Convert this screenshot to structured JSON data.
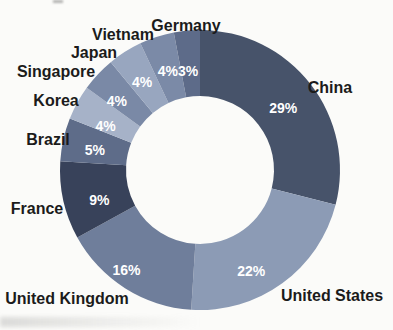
{
  "chart_data": {
    "type": "pie",
    "subtype": "doughnut",
    "title": "",
    "unit": "%",
    "direction": "clockwise",
    "start_angle_deg": 0,
    "hole_radius_ratio": 0.53,
    "legend_position": "none",
    "category_labels_outside": true,
    "categories": [
      "China",
      "United States",
      "United Kingdom",
      "France",
      "Brazil",
      "Korea",
      "Singapore",
      "Japan",
      "Vietnam",
      "Germany"
    ],
    "values": [
      29,
      22,
      16,
      9,
      5,
      4,
      4,
      4,
      4,
      3
    ],
    "slices": [
      {
        "label": "China",
        "value": 29,
        "display": "29%",
        "color": "#47536A"
      },
      {
        "label": "United States",
        "value": 22,
        "display": "22%",
        "color": "#8C9BB5"
      },
      {
        "label": "United Kingdom",
        "value": 16,
        "display": "16%",
        "color": "#6F7E9B"
      },
      {
        "label": "France",
        "value": 9,
        "display": "9%",
        "color": "#38425A"
      },
      {
        "label": "Brazil",
        "value": 5,
        "display": "5%",
        "color": "#5E6C89"
      },
      {
        "label": "Korea",
        "value": 4,
        "display": "4%",
        "color": "#A6B2C8"
      },
      {
        "label": "Singapore",
        "value": 4,
        "display": "4%",
        "color": "#7A89A6"
      },
      {
        "label": "Japan",
        "value": 4,
        "display": "4%",
        "color": "#98A6BF"
      },
      {
        "label": "Vietnam",
        "value": 4,
        "display": "4%",
        "color": "#7B8AA7"
      },
      {
        "label": "Germany",
        "value": 3,
        "display": "3%",
        "color": "#5D6B89"
      }
    ],
    "percent_label_color": "#FFFFFF",
    "category_label_color": "#1B1B1B"
  }
}
